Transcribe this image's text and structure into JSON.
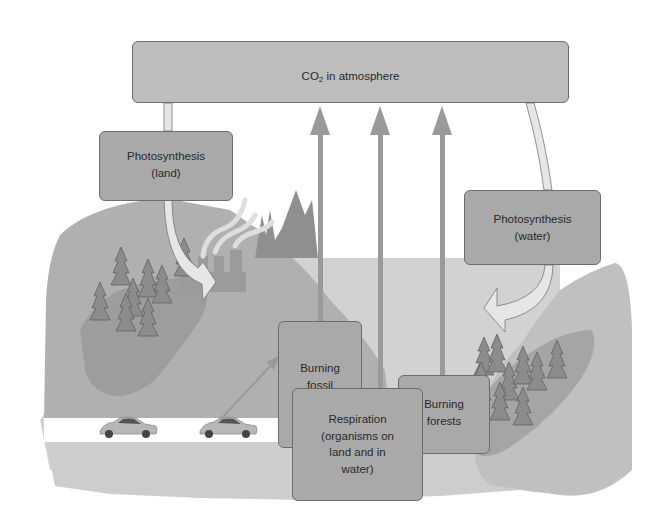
{
  "diagram": {
    "atmosphere": {
      "prefix": "CO",
      "subscript": "2",
      "suffix": " in atmosphere"
    },
    "photosynthesis_land": {
      "line1": "Photosynthesis",
      "line2": "(land)"
    },
    "photosynthesis_water": {
      "line1": "Photosynthesis",
      "line2": "(water)"
    },
    "burning_fossil_fuels": {
      "line1": "Burning",
      "line2": "fossil",
      "line3": "fuels"
    },
    "burning_forests": {
      "line1": "Burning",
      "line2": "forests"
    },
    "respiration": {
      "line1": "Respiration",
      "line2": "(organisms on",
      "line3": "land and in",
      "line4": "water)"
    },
    "arrows": [
      {
        "from": "CO2 in atmosphere",
        "to": "Photosynthesis (land)",
        "style": "curved-hollow"
      },
      {
        "from": "CO2 in atmosphere",
        "to": "Photosynthesis (water)",
        "style": "curved-hollow"
      },
      {
        "from": "Burning fossil fuels",
        "to": "CO2 in atmosphere",
        "style": "straight"
      },
      {
        "from": "Respiration (organisms on land and in water)",
        "to": "CO2 in atmosphere",
        "style": "straight"
      },
      {
        "from": "Burning forests",
        "to": "CO2 in atmosphere",
        "style": "straight"
      },
      {
        "from": "Cars",
        "to": "Burning fossil fuels",
        "style": "straight-thin"
      }
    ],
    "colors": {
      "box_fill": "#a9a9a9",
      "atmosphere_fill": "#bdbdbd",
      "box_border": "#6d6d6d",
      "arrow": "#9a9a9a",
      "land_light": "#b3b3b3",
      "land_mid": "#a0a0a0",
      "tree": "#8a8a8a",
      "water": "#cfcfcf",
      "road": "#ffffff"
    }
  }
}
